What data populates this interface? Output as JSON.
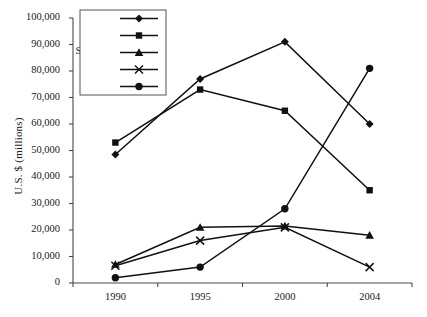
{
  "chart_data": {
    "type": "line",
    "title": "",
    "subtitle": "",
    "xlabel": "",
    "ylabel": "U.S. $ (millions)",
    "x": [
      "1990",
      "1995",
      "2000",
      "2004"
    ],
    "categories": [
      "1990",
      "1995",
      "2000",
      "2004"
    ],
    "ylim": [
      0,
      100000
    ],
    "ytick_labels": [
      "0",
      "10,000",
      "20,000",
      "30,000",
      "40,000",
      "50,000",
      "60,000",
      "70,000",
      "80,000",
      "90,000",
      "100,000"
    ],
    "ytick_values": [
      0,
      10000,
      20000,
      30000,
      40000,
      50000,
      60000,
      70000,
      80000,
      90000,
      100000
    ],
    "grid": false,
    "legend_position": "top-left",
    "series": [
      {
        "name": "U.S.",
        "marker": "diamond",
        "values": [
          48500,
          77000,
          91000,
          60000
        ]
      },
      {
        "name": "Japan",
        "marker": "square",
        "values": [
          53000,
          73000,
          65000,
          35000
        ]
      },
      {
        "name": "Singapore",
        "marker": "triangle",
        "values": [
          7000,
          21000,
          21500,
          18000
        ]
      },
      {
        "name": "Taiwan",
        "marker": "cross",
        "values": [
          6500,
          16000,
          21000,
          6000
        ]
      },
      {
        "name": "China",
        "marker": "circle",
        "values": [
          2000,
          6000,
          28000,
          81000
        ]
      }
    ]
  },
  "legend": {
    "items": [
      {
        "label": "U.S."
      },
      {
        "label": "Japan"
      },
      {
        "label": "Singapore"
      },
      {
        "label": "Taiwan"
      },
      {
        "label": "China"
      }
    ]
  }
}
